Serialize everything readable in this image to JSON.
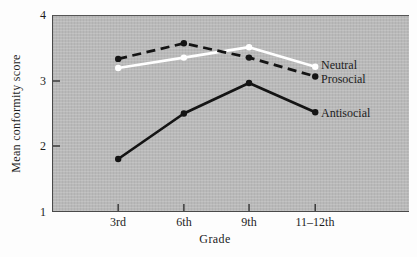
{
  "chart_data": {
    "type": "line",
    "title": "",
    "xlabel": "Grade",
    "ylabel": "Mean conformity score",
    "categories": [
      "3rd",
      "6th",
      "9th",
      "11–12th"
    ],
    "series": [
      {
        "name": "Neutral",
        "color": "#ffffff",
        "line_style": "solid",
        "values": [
          3.2,
          3.36,
          3.52,
          3.22
        ]
      },
      {
        "name": "Prosocial",
        "color": "#141414",
        "line_style": "dashed",
        "values": [
          3.34,
          3.58,
          3.36,
          3.07
        ]
      },
      {
        "name": "Antisocial",
        "color": "#141414",
        "line_style": "solid",
        "values": [
          1.8,
          2.5,
          2.97,
          2.52
        ]
      }
    ],
    "ylim": [
      1,
      4
    ],
    "ytick_labels": [
      "4",
      "3",
      "2",
      "1"
    ],
    "yticks_with_marks": [
      3,
      2
    ],
    "grid": false,
    "legend_position": "inline-right-on-panel",
    "panel_color": "#b9b9b9",
    "axis_color": "#3c3c3c"
  }
}
